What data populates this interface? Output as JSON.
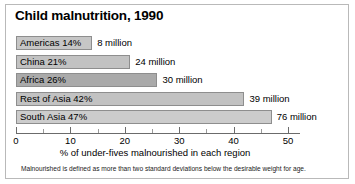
{
  "chart_data": {
    "type": "bar",
    "orientation": "horizontal",
    "title": "Child malnutrition, 1990",
    "xlabel": "% of under-fives malnourished in each region",
    "ylabel": "",
    "xlim": [
      0,
      50
    ],
    "xticks": [
      0,
      10,
      20,
      30,
      40,
      50
    ],
    "xtick_labels": [
      "0",
      "10",
      "20",
      "30",
      "40",
      "50"
    ],
    "minor_ticks": [
      5,
      15,
      25,
      35,
      45
    ],
    "grid": false,
    "legend": null,
    "categories": [
      "Americas",
      "China",
      "Africa",
      "Rest of Asia",
      "South Asia"
    ],
    "values": [
      14,
      21,
      26,
      42,
      47
    ],
    "bars": [
      {
        "label": "Americas 14%",
        "category": "Americas",
        "percent": 14,
        "value_label": "8 million",
        "millions": 8,
        "color": "#c6c6c6"
      },
      {
        "label": "China 21%",
        "category": "China",
        "percent": 21,
        "value_label": "24 million",
        "millions": 24,
        "color": "#c2c2c2"
      },
      {
        "label": "Africa 26%",
        "category": "Africa",
        "percent": 26,
        "value_label": "30 million",
        "millions": 30,
        "color": "#aaaaaa"
      },
      {
        "label": "Rest of Asia 42%",
        "category": "Rest of Asia",
        "percent": 42,
        "value_label": "39 million",
        "millions": 39,
        "color": "#c2c2c2"
      },
      {
        "label": "South Asia 47%",
        "category": "South Asia",
        "percent": 47,
        "value_label": "76 million",
        "millions": 76,
        "color": "#cccccc"
      }
    ],
    "footnote": "Malnourished is defined as more than two standard deviations below the desirable weight for age.",
    "colors": {
      "axis": "#6b6b6b",
      "bar_border": "#8e8e8e",
      "frame": "#b9b9b9",
      "text": "#000000"
    }
  }
}
